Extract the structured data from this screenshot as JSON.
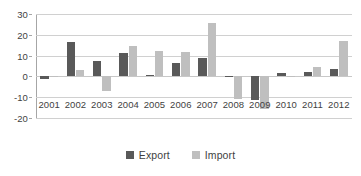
{
  "chart_data": {
    "type": "bar",
    "title": "",
    "subtitle": "",
    "xlabel": "",
    "ylabel": "",
    "categories": [
      "2001",
      "2002",
      "2003",
      "2004",
      "2005",
      "2006",
      "2007",
      "2008",
      "2009",
      "2010",
      "2011",
      "2012"
    ],
    "series": [
      {
        "name": "Export",
        "color": "#595959",
        "values": [
          -1.3,
          16.7,
          7.4,
          11.3,
          0.9,
          6.3,
          9.0,
          0.4,
          -11.5,
          1.5,
          2.0,
          3.7
        ]
      },
      {
        "name": "Import",
        "color": "#bfbfbf",
        "values": [
          -0.3,
          3.0,
          -7.0,
          14.5,
          12.3,
          11.7,
          25.5,
          -11.0,
          -15.5,
          0.3,
          4.7,
          16.8
        ]
      }
    ],
    "ylim": [
      -20,
      30
    ],
    "yticks": [
      30,
      20,
      10,
      0,
      -10,
      -20
    ],
    "ytick_labels": [
      "30",
      "20",
      "10",
      "0",
      "-10",
      "-20"
    ],
    "grid": true,
    "legend_position": "bottom",
    "annotations": []
  },
  "legend": {
    "items": [
      {
        "label": "Export",
        "color": "#595959"
      },
      {
        "label": "Import",
        "color": "#bfbfbf"
      }
    ]
  },
  "colors": {
    "export": "#595959",
    "import": "#bfbfbf",
    "gridline": "#d0d0d0",
    "axis": "#a6a6a6",
    "text": "#3f3f3f",
    "background": "#ffffff"
  }
}
